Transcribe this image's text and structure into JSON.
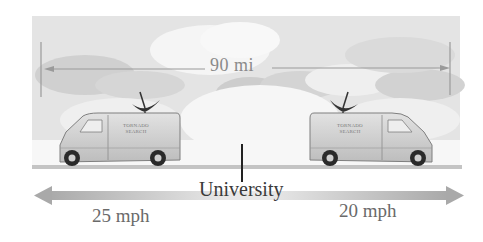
{
  "diagram": {
    "distance_label": "90 mi",
    "landmark_label": "University",
    "left_van": {
      "text_line1": "TORNADO",
      "text_line2": "SEARCH",
      "speed_label": "25 mph",
      "direction": "left"
    },
    "right_van": {
      "text_line1": "TORNADO",
      "text_line2": "SEARCH",
      "speed_label": "20 mph",
      "direction": "right"
    }
  },
  "colors": {
    "sky": "#e6e6e6",
    "cloud_light": "#f4f4f4",
    "cloud_dark": "#cfcfcf",
    "van_body": "#d2d2d2",
    "van_outline": "#8a8a8a",
    "arrow": "#b5b5b5",
    "road": "#bdbdbd",
    "text_dark": "#3a3a3a",
    "text_mid": "#6a6a6a"
  }
}
